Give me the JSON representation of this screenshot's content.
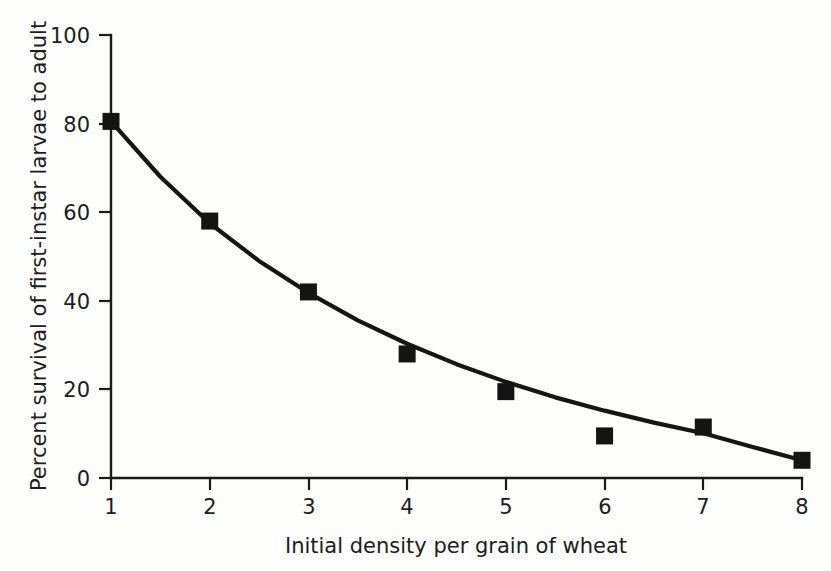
{
  "chart_data": {
    "type": "scatter",
    "title": "",
    "subtitle": "",
    "xlabel": "Initial density per grain of wheat",
    "ylabel": "Percent survival of first-instar larvae to adult",
    "xlim": [
      1,
      8
    ],
    "ylim": [
      0,
      100
    ],
    "x_ticks": [
      "1",
      "2",
      "3",
      "4",
      "5",
      "6",
      "7",
      "8"
    ],
    "y_ticks": [
      "0",
      "20",
      "40",
      "60",
      "80",
      "100"
    ],
    "x_tick_values": [
      1,
      2,
      3,
      4,
      5,
      6,
      7,
      8
    ],
    "y_tick_values": [
      0,
      20,
      40,
      60,
      80,
      100
    ],
    "grid": false,
    "legend": "none",
    "marker_style": "filled-square",
    "x": [
      1,
      2,
      3,
      4,
      5,
      6,
      7,
      8
    ],
    "values": [
      80.5,
      58,
      42,
      28,
      19.5,
      9.5,
      11.5,
      4
    ],
    "series": [
      {
        "name": "Percent survival",
        "x": [
          1,
          2,
          3,
          4,
          5,
          6,
          7,
          8
        ],
        "values": [
          80.5,
          58,
          42,
          28,
          19.5,
          9.5,
          11.5,
          4
        ]
      },
      {
        "name": "fitted curve",
        "type": "line",
        "x": [
          1,
          1.5,
          2,
          2.5,
          3,
          3.5,
          4,
          4.5,
          5,
          5.5,
          6,
          6.5,
          7,
          7.5,
          8
        ],
        "values": [
          80.5,
          68.0,
          57.5,
          49.0,
          41.8,
          35.6,
          30.3,
          25.7,
          21.7,
          18.2,
          15.2,
          12.5,
          10.1,
          7.0,
          4.0
        ]
      }
    ],
    "colors": {
      "ink": "#141414",
      "background": "#fdfdfb"
    }
  }
}
